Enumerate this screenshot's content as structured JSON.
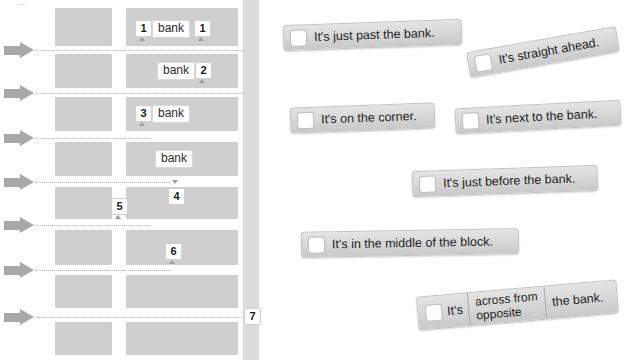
{
  "map": {
    "corner_mark": "—",
    "street_label_alt": "street",
    "bank_label": "bank",
    "banks": [
      {
        "row": 1,
        "label": "bank"
      },
      {
        "row": 2,
        "label": "bank"
      },
      {
        "row": 3,
        "label": "bank"
      },
      {
        "row": 4,
        "label": "bank"
      }
    ],
    "numbers": [
      {
        "id": "n1a",
        "label": "1"
      },
      {
        "id": "n1b",
        "label": "1"
      },
      {
        "id": "n2",
        "label": "2"
      },
      {
        "id": "n3",
        "label": "3"
      },
      {
        "id": "n4",
        "label": "4"
      },
      {
        "id": "n5",
        "label": "5"
      },
      {
        "id": "n6",
        "label": "6"
      },
      {
        "id": "n7",
        "label": "7"
      }
    ],
    "colors": {
      "block": "#cfcfcf",
      "street_dotted": "#b9b9b9",
      "vertical_street": "#dcdcdc",
      "arrow": "#a8a8a8"
    }
  },
  "cards": [
    {
      "id": "card-just-past",
      "text": "It's just past the bank."
    },
    {
      "id": "card-straight",
      "text": "It's straight ahead."
    },
    {
      "id": "card-corner",
      "text": "It's on the corner."
    },
    {
      "id": "card-next-to",
      "text": "It's next to the bank."
    },
    {
      "id": "card-just-before",
      "text": "It's just before the bank."
    },
    {
      "id": "card-middle",
      "text": "It's in the middle of the block."
    }
  ],
  "compound_card": {
    "id": "card-across-opposite",
    "prefix": "It's",
    "option_top": "across from",
    "option_bottom": "opposite",
    "suffix": "the bank."
  },
  "colors": {
    "card_fill": "#d8d8d8",
    "card_border": "#c2c2c2",
    "checkbox_fill": "#ffffff",
    "text": "#1e1e1e"
  }
}
